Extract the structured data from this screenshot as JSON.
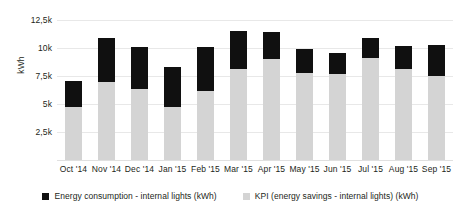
{
  "chart_data": {
    "type": "bar",
    "stacked": true,
    "title": "",
    "subtitle": "",
    "xlabel": "",
    "ylabel": "kWh",
    "ylim": [
      0,
      12500
    ],
    "ytick_values": [
      12500,
      10000,
      7500,
      5000,
      2500
    ],
    "ytick_labels": [
      "12,5k",
      "10k",
      "7,5k",
      "5k",
      "2,5k"
    ],
    "grid": true,
    "legend_position": "bottom",
    "categories": [
      "Oct '14",
      "Nov '14",
      "Dec '14",
      "Jan '15",
      "Feb '15",
      "Mar '15",
      "Apr '15",
      "May '15",
      "Jun '15",
      "Jul '15",
      "Aug '15",
      "Sep '15"
    ],
    "series": [
      {
        "name": "KPI (energy savings - internal lights) (kWh)",
        "color": "#d4d4d4",
        "values": [
          4700,
          7000,
          6300,
          4700,
          6200,
          8100,
          9000,
          7800,
          7700,
          9100,
          8100,
          7500
        ]
      },
      {
        "name": "Energy consumption - internal lights (kWh)",
        "color": "#101010",
        "values": [
          2400,
          3900,
          3800,
          3600,
          3900,
          3400,
          2400,
          2100,
          1900,
          1800,
          2100,
          2800
        ]
      }
    ],
    "totals": [
      7100,
      10900,
      10100,
      8300,
      10100,
      11500,
      11400,
      9900,
      9600,
      10900,
      10200,
      10300
    ]
  },
  "legend": {
    "items": [
      {
        "label": "Energy consumption - internal lights (kWh)",
        "color": "#101010"
      },
      {
        "label": "KPI (energy savings - internal lights) (kWh)",
        "color": "#d4d4d4"
      }
    ]
  }
}
